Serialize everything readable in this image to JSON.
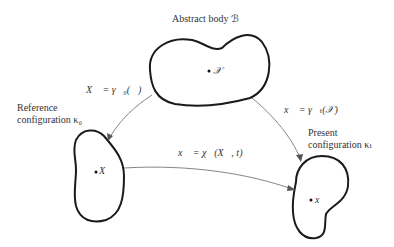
{
  "abstract_body": {
    "label": "Abstract body ℬ",
    "point_label": "𝒳"
  },
  "reference_configuration": {
    "label_line1": "Reference",
    "label_line2": "configuration κ₀",
    "point_label": "X⃗"
  },
  "present_configuration": {
    "label_line1": "Present",
    "label_line2": "configuration κₜ",
    "point_label": "x⃗"
  },
  "mappings": {
    "reference_map": "X⃗ = γ⃗₀(𝒳)",
    "present_map": "x⃗ = γ⃗ₜ(𝒳)",
    "motion_map": "x⃗ = χ⃗(X⃗, t)"
  },
  "colors": {
    "outline": "#1a1a1a",
    "arrow": "#777777",
    "text": "#333333"
  }
}
